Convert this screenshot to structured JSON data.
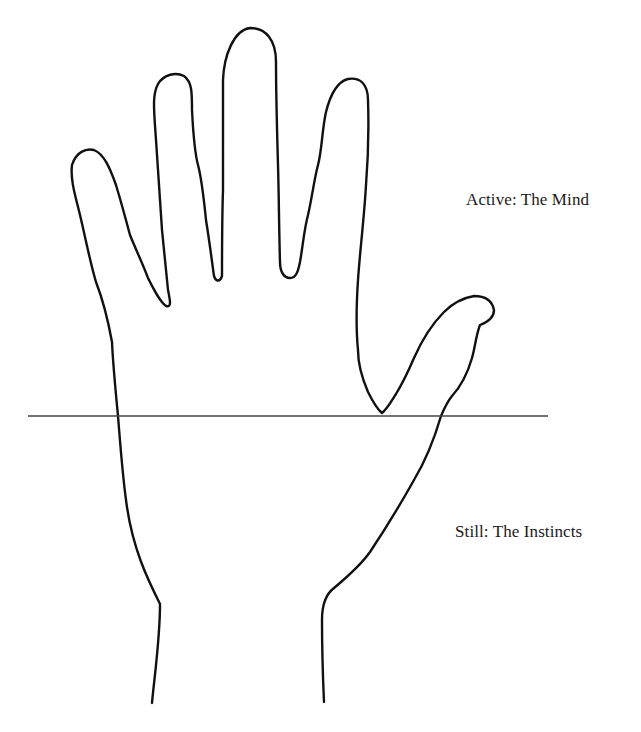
{
  "diagram": {
    "type": "hand-outline-illustration",
    "labels": {
      "upper": "Active: The Mind",
      "lower": "Still: The Instincts"
    },
    "divider": {
      "description": "horizontal line across base of fingers / top of palm",
      "x_start": 28,
      "x_end": 548,
      "y": 416
    },
    "colors": {
      "background": "#ffffff",
      "outline": "#111111",
      "divider": "#444444",
      "text": "#1a1a1a"
    }
  }
}
